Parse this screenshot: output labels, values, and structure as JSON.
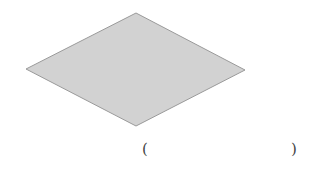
{
  "diagram": {
    "shape": "rhombus",
    "vertices": {
      "top": [
        136,
        13
      ],
      "left": [
        26,
        69
      ],
      "right": [
        245,
        70
      ],
      "bottom": [
        136,
        126
      ]
    },
    "fill_color": "#d2d2d2",
    "stroke_color": "#9a9a9a"
  },
  "answer_blank": {
    "open": "(",
    "close": ")",
    "value": ""
  }
}
